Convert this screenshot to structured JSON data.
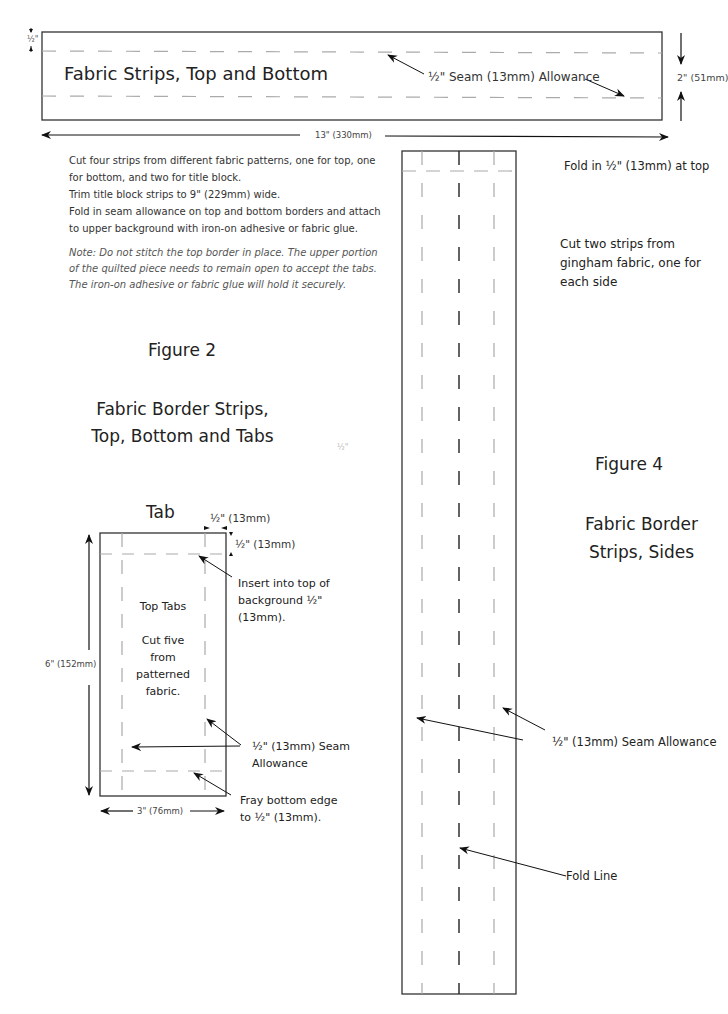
{
  "figure_top": {
    "strip_title": "Fabric Strips, Top and Bottom",
    "seam_label": "½\" Seam (13mm) Allowance",
    "half_inch_label": "½\"",
    "height_label": "2\" (51mm)",
    "width_label": "13\" (330mm)",
    "instructions": [
      "Cut four strips from different fabric patterns, one for top, one for bottom, and two for title block.",
      "Trim title block strips to 9\" (229mm) wide.",
      "Fold in seam allowance on top and bottom borders and attach to upper background with iron-on adhesive or fabric glue."
    ],
    "note": "Note:  Do not stitch the top border in place.  The upper portion of the quilted piece needs to remain open to accept the tabs. The iron-on adhesive or fabric glue will hold it securely."
  },
  "figure2": {
    "number": "Figure 2",
    "title_line1": "Fabric Border Strips,",
    "title_line2": "Top, Bottom and Tabs",
    "stray_label": "½\""
  },
  "tab": {
    "title": "Tab",
    "side_margin_label": "½\" (13mm)",
    "top_margin_label": "½\" (13mm)",
    "insert_label_1": "Insert into top of",
    "insert_label_2": "background ½\"",
    "insert_label_3": "(13mm).",
    "inner_title": "Top Tabs",
    "inner_line1": "Cut five",
    "inner_line2": "from",
    "inner_line3": "patterned",
    "inner_line4": "fabric.",
    "height_label": "6\" (152mm)",
    "seam_label_1": "½\" (13mm) Seam",
    "seam_label_2": "Allowance",
    "fray_label_1": "Fray bottom edge",
    "fray_label_2": "to ½\" (13mm).",
    "width_label": "3\" (76mm)"
  },
  "figure4": {
    "fold_top_label": "Fold in ½\" (13mm) at top",
    "cut_line1": "Cut two strips from",
    "cut_line2": "gingham fabric, one for",
    "cut_line3": "each side",
    "number": "Figure 4",
    "title_line1": "Fabric Border",
    "title_line2": "Strips, Sides",
    "seam_label": "½\" (13mm) Seam Allowance",
    "fold_line_label": "Fold Line"
  }
}
